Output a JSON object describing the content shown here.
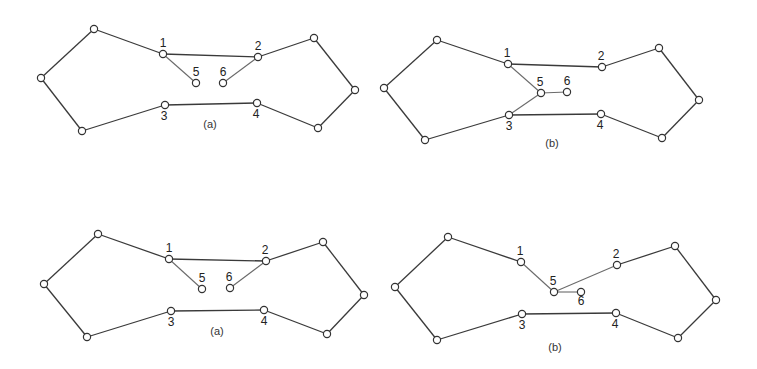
{
  "colors": {
    "background": "#ffffff",
    "edge": "#3a3a3a",
    "inner_edge": "#6a6a6a",
    "node_stroke": "#333333",
    "text": "#222222"
  },
  "panels": [
    {
      "id": "top-left",
      "caption": "(a)",
      "caption_pos": [
        210,
        128
      ],
      "nodes": [
        {
          "id": "tl",
          "x": 94,
          "y": 29,
          "label": ""
        },
        {
          "id": "l",
          "x": 41,
          "y": 78,
          "label": ""
        },
        {
          "id": "bl",
          "x": 82,
          "y": 131,
          "label": ""
        },
        {
          "id": "n1",
          "x": 163,
          "y": 54,
          "label": "1",
          "lx": 163,
          "ly": 47
        },
        {
          "id": "n2",
          "x": 258,
          "y": 57,
          "label": "2",
          "lx": 258,
          "ly": 50
        },
        {
          "id": "n5",
          "x": 196,
          "y": 83,
          "label": "5",
          "lx": 196,
          "ly": 76
        },
        {
          "id": "n6",
          "x": 223,
          "y": 83,
          "label": "6",
          "lx": 223,
          "ly": 76
        },
        {
          "id": "n3",
          "x": 165,
          "y": 105,
          "label": "3",
          "lx": 164,
          "ly": 120
        },
        {
          "id": "n4",
          "x": 257,
          "y": 103,
          "label": "4",
          "lx": 256,
          "ly": 118
        },
        {
          "id": "tr",
          "x": 314,
          "y": 38,
          "label": ""
        },
        {
          "id": "r",
          "x": 355,
          "y": 90,
          "label": ""
        },
        {
          "id": "br",
          "x": 318,
          "y": 128,
          "label": ""
        }
      ],
      "edges": [
        [
          "tl",
          "l"
        ],
        [
          "l",
          "bl"
        ],
        [
          "bl",
          "n3"
        ],
        [
          "n3",
          "n4"
        ],
        [
          "n4",
          "br"
        ],
        [
          "br",
          "r"
        ],
        [
          "r",
          "tr"
        ],
        [
          "tr",
          "n2"
        ],
        [
          "n2",
          "n1"
        ],
        [
          "n1",
          "tl"
        ]
      ],
      "inner_edges": [
        [
          "n1",
          "n5"
        ],
        [
          "n2",
          "n6"
        ]
      ]
    },
    {
      "id": "top-right",
      "caption": "(b)",
      "caption_pos": [
        552,
        147
      ],
      "nodes": [
        {
          "id": "tl",
          "x": 437,
          "y": 40,
          "label": ""
        },
        {
          "id": "l",
          "x": 384,
          "y": 88,
          "label": ""
        },
        {
          "id": "bl",
          "x": 425,
          "y": 140,
          "label": ""
        },
        {
          "id": "n1",
          "x": 508,
          "y": 64,
          "label": "1",
          "lx": 507,
          "ly": 57
        },
        {
          "id": "n2",
          "x": 602,
          "y": 67,
          "label": "2",
          "lx": 601,
          "ly": 60
        },
        {
          "id": "n5",
          "x": 541,
          "y": 93,
          "label": "5",
          "lx": 540,
          "ly": 86
        },
        {
          "id": "n6",
          "x": 567,
          "y": 92,
          "label": "6",
          "lx": 567,
          "ly": 85
        },
        {
          "id": "n3",
          "x": 509,
          "y": 115,
          "label": "3",
          "lx": 509,
          "ly": 130
        },
        {
          "id": "n4",
          "x": 601,
          "y": 114,
          "label": "4",
          "lx": 600,
          "ly": 129
        },
        {
          "id": "tr",
          "x": 659,
          "y": 48,
          "label": ""
        },
        {
          "id": "r",
          "x": 699,
          "y": 100,
          "label": ""
        },
        {
          "id": "br",
          "x": 662,
          "y": 138,
          "label": ""
        }
      ],
      "edges": [
        [
          "tl",
          "l"
        ],
        [
          "l",
          "bl"
        ],
        [
          "bl",
          "n3"
        ],
        [
          "n3",
          "n4"
        ],
        [
          "n4",
          "br"
        ],
        [
          "br",
          "r"
        ],
        [
          "r",
          "tr"
        ],
        [
          "tr",
          "n2"
        ],
        [
          "n2",
          "n1"
        ],
        [
          "n1",
          "tl"
        ]
      ],
      "inner_edges": [
        [
          "n1",
          "n5"
        ],
        [
          "n5",
          "n3"
        ],
        [
          "n5",
          "n6"
        ]
      ]
    },
    {
      "id": "bottom-left",
      "caption": "(a)",
      "caption_pos": [
        217,
        335
      ],
      "nodes": [
        {
          "id": "tl",
          "x": 98,
          "y": 234,
          "label": ""
        },
        {
          "id": "l",
          "x": 44,
          "y": 284,
          "label": ""
        },
        {
          "id": "bl",
          "x": 87,
          "y": 337,
          "label": ""
        },
        {
          "id": "n1",
          "x": 169,
          "y": 259,
          "label": "1",
          "lx": 169,
          "ly": 252
        },
        {
          "id": "n2",
          "x": 266,
          "y": 261,
          "label": "2",
          "lx": 265,
          "ly": 254
        },
        {
          "id": "n5",
          "x": 202,
          "y": 289,
          "label": "5",
          "lx": 202,
          "ly": 282
        },
        {
          "id": "n6",
          "x": 230,
          "y": 288,
          "label": "6",
          "lx": 229,
          "ly": 281
        },
        {
          "id": "n3",
          "x": 171,
          "y": 311,
          "label": "3",
          "lx": 171,
          "ly": 326
        },
        {
          "id": "n4",
          "x": 264,
          "y": 310,
          "label": "4",
          "lx": 264,
          "ly": 325
        },
        {
          "id": "tr",
          "x": 323,
          "y": 242,
          "label": ""
        },
        {
          "id": "r",
          "x": 364,
          "y": 295,
          "label": ""
        },
        {
          "id": "br",
          "x": 327,
          "y": 334,
          "label": ""
        }
      ],
      "edges": [
        [
          "tl",
          "l"
        ],
        [
          "l",
          "bl"
        ],
        [
          "bl",
          "n3"
        ],
        [
          "n3",
          "n4"
        ],
        [
          "n4",
          "br"
        ],
        [
          "br",
          "r"
        ],
        [
          "r",
          "tr"
        ],
        [
          "tr",
          "n2"
        ],
        [
          "n2",
          "n1"
        ],
        [
          "n1",
          "tl"
        ]
      ],
      "inner_edges": [
        [
          "n1",
          "n5"
        ],
        [
          "n2",
          "n6"
        ]
      ]
    },
    {
      "id": "bottom-right",
      "caption": "(b)",
      "caption_pos": [
        555,
        351
      ],
      "nodes": [
        {
          "id": "tl",
          "x": 448,
          "y": 237,
          "label": ""
        },
        {
          "id": "l",
          "x": 395,
          "y": 287,
          "label": ""
        },
        {
          "id": "bl",
          "x": 437,
          "y": 340,
          "label": ""
        },
        {
          "id": "n1",
          "x": 521,
          "y": 262,
          "label": "1",
          "lx": 520,
          "ly": 255
        },
        {
          "id": "n2",
          "x": 617,
          "y": 265,
          "label": "2",
          "lx": 616,
          "ly": 258
        },
        {
          "id": "n5",
          "x": 554,
          "y": 292,
          "label": "5",
          "lx": 553,
          "ly": 285
        },
        {
          "id": "n6",
          "x": 581,
          "y": 292,
          "label": "6",
          "lx": 581,
          "ly": 305
        },
        {
          "id": "n3",
          "x": 522,
          "y": 314,
          "label": "3",
          "lx": 522,
          "ly": 329
        },
        {
          "id": "n4",
          "x": 616,
          "y": 313,
          "label": "4",
          "lx": 615,
          "ly": 328
        },
        {
          "id": "tr",
          "x": 675,
          "y": 246,
          "label": ""
        },
        {
          "id": "r",
          "x": 716,
          "y": 300,
          "label": ""
        },
        {
          "id": "br",
          "x": 678,
          "y": 338,
          "label": ""
        }
      ],
      "edges": [
        [
          "tl",
          "l"
        ],
        [
          "l",
          "bl"
        ],
        [
          "bl",
          "n3"
        ],
        [
          "n3",
          "n4"
        ],
        [
          "n4",
          "br"
        ],
        [
          "br",
          "r"
        ],
        [
          "r",
          "tr"
        ],
        [
          "tr",
          "n2"
        ],
        [
          "n1",
          "tl"
        ]
      ],
      "inner_edges": [
        [
          "n1",
          "n5"
        ],
        [
          "n5",
          "n2"
        ],
        [
          "n5",
          "n6"
        ]
      ]
    }
  ]
}
